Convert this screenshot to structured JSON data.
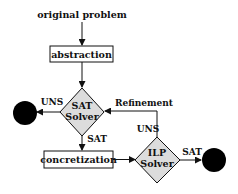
{
  "diagram": {
    "type": "flowchart",
    "start": {
      "label": "original problem"
    },
    "nodes": {
      "abstraction": {
        "label": "abstraction",
        "shape": "rectangle"
      },
      "sat_solver": {
        "line1": "SAT",
        "line2": "Solver",
        "shape": "diamond"
      },
      "concretization": {
        "label": "concretization",
        "shape": "rectangle"
      },
      "ilp_solver": {
        "line1": "ILP",
        "line2": "Solver",
        "shape": "diamond"
      },
      "terminal_left": {
        "shape": "filled-circle"
      },
      "terminal_right": {
        "shape": "filled-circle"
      }
    },
    "edges": {
      "sat_to_left": {
        "label": "UNS"
      },
      "sat_to_concretization": {
        "label": "SAT"
      },
      "ilp_refinement": {
        "label": "Refinement"
      },
      "ilp_uns": {
        "label": "UNS"
      },
      "ilp_to_right": {
        "label": "SAT"
      }
    },
    "colors": {
      "diamond_fill": "#dcdcdc",
      "stroke": "#111111",
      "terminal": "#000000",
      "box_fill": "#ffffff"
    }
  }
}
